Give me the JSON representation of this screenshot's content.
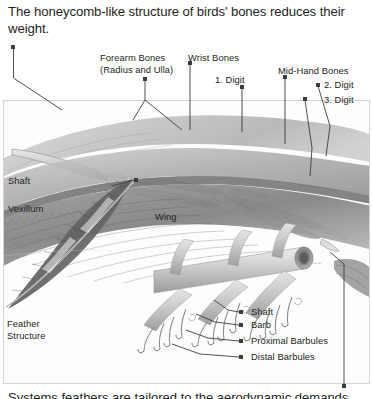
{
  "title": "The honeycomb-like structure of birds' bones reduces their weight.",
  "caption": "Systems feathers are tailored to the aerodynamic demands",
  "colors": {
    "text": "#231f20",
    "marker": "#3b3b44",
    "leader": "#3b3b44",
    "panel_border": "#d4d4d8",
    "panel_bg": "#fdfdfd"
  },
  "wing_panel": {
    "labels": [
      {
        "id": "forearm-bones",
        "line1": "Forearm Bones",
        "line2": "(Radius and Ulla)"
      },
      {
        "id": "wrist-bones",
        "line1": "Wrist Bones",
        "line2": ""
      },
      {
        "id": "first-digit",
        "line1": "1. Digit",
        "line2": ""
      },
      {
        "id": "mid-hand-bones",
        "line1": "Mid-Hand Bones",
        "line2": ""
      },
      {
        "id": "second-digit",
        "line1": "2. Digit",
        "line2": ""
      },
      {
        "id": "third-digit",
        "line1": "3. Digit",
        "line2": ""
      },
      {
        "id": "shaft",
        "line1": "Shaft",
        "line2": ""
      },
      {
        "id": "vexillum",
        "line1": "Vexillum",
        "line2": ""
      },
      {
        "id": "wing",
        "line1": "Wing",
        "line2": ""
      }
    ]
  },
  "feather_panel": {
    "group_label_line1": "Feather",
    "group_label_line2": "Structure",
    "labels": [
      {
        "id": "feather-shaft",
        "text": "Shaft"
      },
      {
        "id": "feather-barb",
        "text": "Barb"
      },
      {
        "id": "proximal-barbules",
        "text": "Proximal Barbules"
      },
      {
        "id": "distal-barbules",
        "text": "Distal Barbules"
      }
    ]
  }
}
